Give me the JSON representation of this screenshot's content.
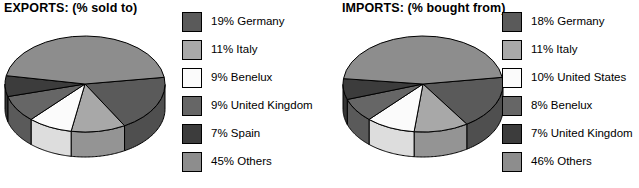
{
  "charts": [
    {
      "id": "exports",
      "title": "EXPORTS: (% sold to)",
      "chart_data": {
        "type": "pie",
        "title": "EXPORTS: (% sold to)",
        "unit": "%",
        "categories": [
          "Germany",
          "Italy",
          "Benelux",
          "United Kingdom",
          "Spain",
          "Others"
        ],
        "values": [
          19,
          11,
          9,
          9,
          7,
          45
        ],
        "labels": [
          "19% Germany",
          "11% Italy",
          "9% Benelux",
          "9% United Kingdom",
          "7% Spain",
          "45% Others"
        ],
        "colors": [
          "#5a5a5a",
          "#a8a8a8",
          "#fbfbfb",
          "#666666",
          "#3c3c3c",
          "#8d8d8d"
        ],
        "legend_position": "right",
        "three_d": true,
        "start_angle_deg": -8,
        "direction": "clockwise"
      }
    },
    {
      "id": "imports",
      "title": "IMPORTS: (% bought from)",
      "chart_data": {
        "type": "pie",
        "title": "IMPORTS: (% bought from)",
        "unit": "%",
        "categories": [
          "Germany",
          "Italy",
          "United States",
          "Benelux",
          "United Kingdom",
          "Others"
        ],
        "values": [
          18,
          11,
          10,
          8,
          7,
          46
        ],
        "labels": [
          "18% Germany",
          "11% Italy",
          "10% United States",
          "8% Benelux",
          "7% United Kingdom",
          "46% Others"
        ],
        "colors": [
          "#5a5a5a",
          "#a8a8a8",
          "#fbfbfb",
          "#666666",
          "#3c3c3c",
          "#8d8d8d"
        ],
        "legend_position": "right",
        "three_d": true,
        "start_angle_deg": -8,
        "direction": "clockwise"
      }
    }
  ],
  "style": {
    "background": "#ffffff",
    "text_color": "#000000",
    "outline_color": "#000000"
  }
}
